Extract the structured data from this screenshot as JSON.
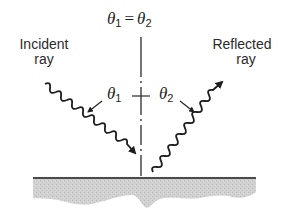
{
  "diagram": {
    "title_equation": {
      "lhs_symbol": "θ",
      "lhs_sub": "1",
      "operator": "=",
      "rhs_symbol": "θ",
      "rhs_sub": "2"
    },
    "incident_label": {
      "line1": "Incident",
      "line2": "ray"
    },
    "reflected_label": {
      "line1": "Reflected",
      "line2": "ray"
    },
    "angle_incident": {
      "symbol": "θ",
      "sub": "1"
    },
    "angle_reflected": {
      "symbol": "θ",
      "sub": "2"
    },
    "colors": {
      "ink": "#1e1e1e",
      "surface_line": "#4a4a4a",
      "material_fill": "#cfcfcf"
    }
  }
}
